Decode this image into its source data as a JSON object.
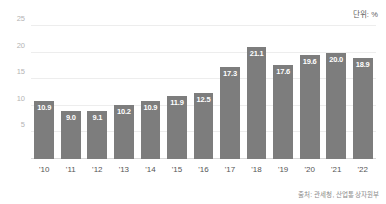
{
  "chart_data": {
    "type": "bar",
    "title": "",
    "subtitle": "",
    "xlabel": "",
    "ylabel": "",
    "unit_note": "단위: %",
    "source_note": "출처: 관세청, 산업통상자원부",
    "categories": [
      "'10",
      "'11",
      "'12",
      "'13",
      "'14",
      "'15",
      "'16",
      "'17",
      "'18",
      "'19",
      "'20",
      "'21",
      "'22"
    ],
    "values": [
      10.9,
      9.0,
      9.1,
      10.2,
      10.9,
      11.9,
      12.5,
      17.3,
      21.1,
      17.6,
      19.6,
      20.0,
      18.9
    ],
    "value_labels": [
      "10.9",
      "9.0",
      "9.1",
      "10.2",
      "10.9",
      "11.9",
      "12.5",
      "17.3",
      "21.1",
      "17.6",
      "19.6",
      "20.0",
      "18.9"
    ],
    "ylim": [
      0,
      26.5
    ],
    "yticks": [
      5,
      10,
      15,
      20,
      25
    ],
    "ytick_labels": [
      "5",
      "10",
      "15",
      "20",
      "25"
    ],
    "grid": true,
    "legend": false,
    "legend_position": "none",
    "colors": {
      "bar": "#7d7d7d",
      "value_label": "#ffffff",
      "gridline": "#ededed",
      "baseline": "#d8d8d8",
      "ytick_label": "#b4b4b4",
      "xtick_label": "#555555",
      "unit_note": "#5c5c5c",
      "source_note": "#8a8a8a",
      "background": "#ffffff"
    }
  }
}
